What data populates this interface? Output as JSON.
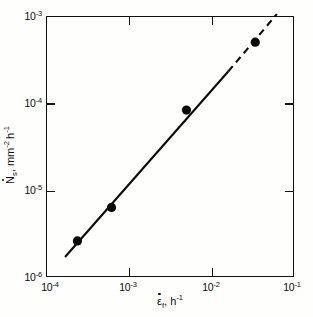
{
  "chart_data": {
    "type": "scatter",
    "title": "",
    "subtitle": "",
    "xlabel": "ε̇f, h⁻¹",
    "ylabel": "Ṅs, mm⁻² h⁻¹",
    "xscale": "log",
    "yscale": "log",
    "xlim": [
      0.0001,
      0.1
    ],
    "ylim": [
      1e-06,
      0.001
    ],
    "grid": false,
    "legend": null,
    "x": [
      0.00024,
      0.00062,
      0.005,
      0.034
    ],
    "y": [
      2.6e-06,
      6.3e-06,
      8.3e-05,
      0.0005
    ],
    "series": [
      {
        "name": "cavity nucleation rate",
        "marker": "filled-circle",
        "x": [
          0.00024,
          0.00062,
          0.005,
          0.034
        ],
        "y": [
          2.6e-06,
          6.3e-06,
          8.3e-05,
          0.0005
        ]
      },
      {
        "name": "fitted line (solid segment)",
        "style": "solid",
        "x": [
          0.00017,
          0.016
        ],
        "y": [
          1.7e-06,
          0.00023
        ]
      },
      {
        "name": "fitted line (dashed extrapolation)",
        "style": "dashed",
        "x": [
          0.016,
          0.062
        ],
        "y": [
          0.00023,
          0.00105
        ]
      }
    ],
    "xticks": [
      {
        "value": 0.0001,
        "label": "10⁻⁴",
        "mantissa": "10",
        "exponent": "-4"
      },
      {
        "value": 0.001,
        "label": "10⁻³",
        "mantissa": "10",
        "exponent": "-3"
      },
      {
        "value": 0.01,
        "label": "10⁻²",
        "mantissa": "10",
        "exponent": "-2"
      },
      {
        "value": 0.1,
        "label": "10⁻¹",
        "mantissa": "10",
        "exponent": "-1"
      }
    ],
    "yticks": [
      {
        "value": 0.001,
        "label": "10⁻³",
        "mantissa": "10",
        "exponent": "-3"
      },
      {
        "value": 0.0001,
        "label": "10⁻⁴",
        "mantissa": "10",
        "exponent": "-4"
      },
      {
        "value": 1e-05,
        "label": "10⁻⁵",
        "mantissa": "10",
        "exponent": "-5"
      },
      {
        "value": 1e-06,
        "label": "10⁻⁶",
        "mantissa": "10",
        "exponent": "-6"
      }
    ],
    "colors": {
      "axis": "#111111",
      "marker": "#0a0a0a",
      "line": "#0a0a0a",
      "background": "#fefefc"
    }
  },
  "axis_titles": {
    "x": {
      "symbol": "ε",
      "sub": "f",
      "unit_base": "h",
      "unit_exp": "-1",
      "separator": ", "
    },
    "y": {
      "symbol": "N",
      "sub": "s",
      "unit1_base": "mm",
      "unit1_exp": "-2",
      "unit2_base": "h",
      "unit2_exp": "-1",
      "separator": ", "
    }
  }
}
